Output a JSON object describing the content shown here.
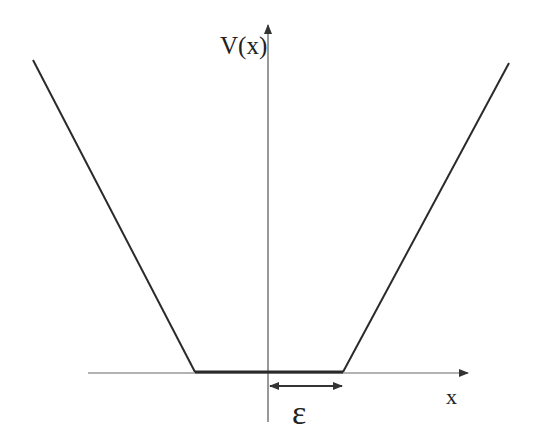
{
  "diagram": {
    "labels": {
      "y_axis": "V(x)",
      "x_axis": "x",
      "width": "ε"
    },
    "colors": {
      "line": "#2a2a2a",
      "axis": "#555555",
      "background": "#ffffff"
    },
    "shape": {
      "type": "piecewise-linear",
      "segments": [
        {
          "name": "left-slope",
          "from": [
            33,
            60
          ],
          "to": [
            195,
            372
          ]
        },
        {
          "name": "flat-bottom",
          "from": [
            195,
            372
          ],
          "to": [
            343,
            372
          ]
        },
        {
          "name": "right-slope",
          "from": [
            343,
            372
          ],
          "to": [
            509,
            63
          ]
        }
      ]
    }
  }
}
